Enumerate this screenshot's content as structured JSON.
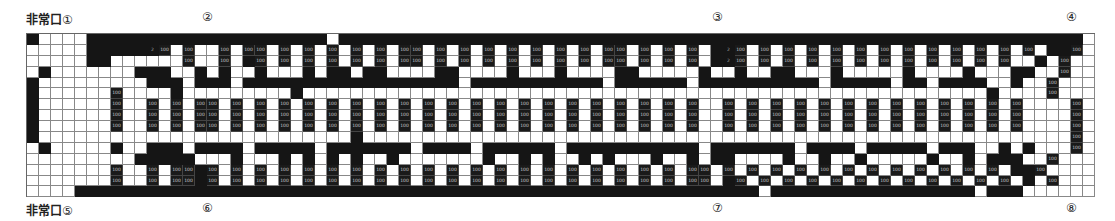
{
  "exits": [
    {
      "id": 1,
      "prefix": "非常口",
      "num": "①",
      "x": 26,
      "y": 10
    },
    {
      "id": 2,
      "prefix": "",
      "num": "②",
      "x": 202,
      "y": 10
    },
    {
      "id": 3,
      "prefix": "",
      "num": "③",
      "x": 712,
      "y": 10
    },
    {
      "id": 4,
      "prefix": "",
      "num": "④",
      "x": 1066,
      "y": 10
    },
    {
      "id": 5,
      "prefix": "非常口",
      "num": "⑤",
      "x": 26,
      "y": 201
    },
    {
      "id": 6,
      "prefix": "",
      "num": "⑥",
      "x": 202,
      "y": 201
    },
    {
      "id": 7,
      "prefix": "",
      "num": "⑦",
      "x": 712,
      "y": 201
    },
    {
      "id": 8,
      "prefix": "",
      "num": "⑧",
      "x": 1066,
      "y": 201
    }
  ],
  "cell_label": "100",
  "alt_label": "2",
  "legend": {
    "black": "wall / aisle block",
    "labeled": "booth (100)",
    "white": "open floor"
  },
  "grid": {
    "columns": 89,
    "rows": [
      "#....####################.##############################################################.#",
      ".....#####2T.T..T.TT.T.T.T.T.T.TT.T.T.T.T.T.T.T.TT.T.T.T.#2T.T.T.T.T.T.T.T.T.T.T.T.T.##T",
      ".....##......T..T.#T.T.T.T.T.T.TT.T.T.T.T.T.T.T.TT.T.T.T.#2T.T.T.T.T.T.T.T.T.T.T.T..#.T",
      ".#.......###..#.#..#...#.##.##....##....#...#....##.....#..#..##...#.....#....#...##..T",
      "#.........###.###.##################.###########.######.##########.#####.##.####..#..T",
      "#......T....#.........#.........................................................#....T",
      "#......T..T.T.TT.T.T.T.T.T.T.T.T.T.T.T.T.T.T.T.T.T.T.T.T..T.T.T.T.T.T.T.T.T.T.T.T.T....T",
      "#......T..T.T.TT.T.T.T.T.T.T.T.T.T.T.T.T.T.T.T.T.T.T.T.T..T.T.T.T.T.T.T.T.T.T.T.T.T....T",
      "#......T..T.T.TT.T.T.T.T.T.T.T.T.T.T.T.T.T.T.T.T.T.T.T.T..T.T.T.T.T.T.T.T.T.T.T.T.T....T",
      "#..........................#...........................................................T",
      ".#.....#..###.####.#####.#######.####.######.###########.#######.####.#####.###..#.#...T",
      ".........#####...#...#.#.#.#..#.......#..#.#..#.#...#..#.##....#..#..#.....#..#.###..T",
      ".......T..T.TT#T.T.T.T.T.T.T.T.T.T.T.T.T.T.T.T.T.T.T.T.TT.T.T.T.T.T.T.T.T.T.T.T.T.##T",
      ".......T..T.TT#T.T.T.T.T.T.T.T.T.T.T.T.T.T.T.T.T.T.T.T.TT.#T.T.T.T.T.T.T.T.T.T.T.T.#.T",
      "....#########################################################.#################.###"
    ]
  }
}
